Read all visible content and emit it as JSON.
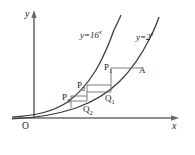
{
  "figure": {
    "background": "#ffffff",
    "stroke_color": "#3a3a3a",
    "axis_color": "#555555",
    "axes": {
      "x_label": "x",
      "y_label": "y",
      "origin_label": "O"
    },
    "curve_labels": {
      "left": {
        "base_text": "y=16",
        "exponent": "x"
      },
      "right": {
        "base_text": "y=2",
        "exponent": "x"
      }
    },
    "points": [
      {
        "id": "P1",
        "base": "P",
        "sub": "1",
        "x": 104,
        "y": 63
      },
      {
        "id": "P2",
        "base": "P",
        "sub": "2",
        "x": 77,
        "y": 81
      },
      {
        "id": "P3",
        "base": "P",
        "sub": "3",
        "x": 62,
        "y": 93
      },
      {
        "id": "Q1",
        "base": "Q",
        "sub": "1",
        "x": 105,
        "y": 94
      },
      {
        "id": "Q2",
        "base": "Q",
        "sub": "2",
        "x": 83,
        "y": 105
      },
      {
        "id": "A",
        "base": "A",
        "sub": "",
        "x": 139,
        "y": 66
      }
    ]
  },
  "chart_data": {
    "type": "line",
    "title": "",
    "xlabel": "x",
    "ylabel": "y",
    "grid": false,
    "legend": "inline-annotations",
    "series": [
      {
        "name": "y=16^x",
        "base": 16,
        "expression": "y = 16^x"
      },
      {
        "name": "y=2^x",
        "base": 2,
        "expression": "y = 2^x"
      }
    ],
    "annotations": [
      "P1",
      "P2",
      "P3",
      "Q1",
      "Q2",
      "A",
      "O"
    ]
  }
}
